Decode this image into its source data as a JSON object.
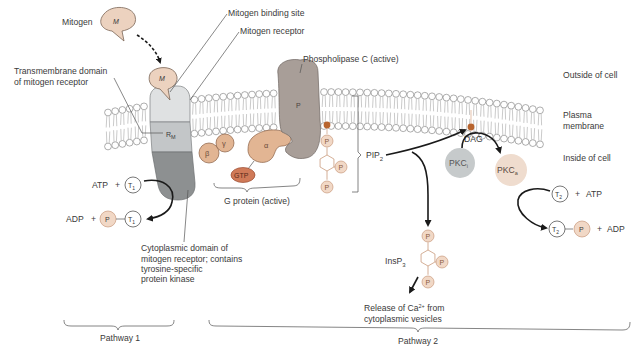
{
  "figure": {
    "labels": {
      "mitogen": "Mitogen",
      "mitogen_binding_site": "Mitogen binding site",
      "mitogen_receptor": "Mitogen receptor",
      "transmembrane_domain_line1": "Transmembrane domain",
      "transmembrane_domain_line2": "of mitogen receptor",
      "phospholipase_c": "Phospholipase C (active)",
      "outside_of_cell": "Outside of cell",
      "plasma_membrane_line1": "Plasma",
      "plasma_membrane_line2": "membrane",
      "inside_of_cell": "Inside of cell",
      "g_protein": "G protein (active)",
      "cytoplasmic_domain_line1": "Cytoplasmic domain of",
      "cytoplasmic_domain_line2": "mitogen receptor; contains",
      "cytoplasmic_domain_line3": "tyrosine-specific",
      "cytoplasmic_domain_line4": "protein kinase",
      "release_ca_line1": "Release of Ca",
      "release_ca_sup": "2+",
      "release_ca_line1_end": " from",
      "release_ca_line2": "cytoplasmic vesicles",
      "pathway_1": "Pathway 1",
      "pathway_2": "Pathway 2"
    },
    "molecules": {
      "mitogen_symbol": "M",
      "receptor_symbol": "R",
      "receptor_subscript": "M",
      "plc_symbol": "P",
      "beta": "β",
      "gamma": "γ",
      "alpha": "α",
      "gtp": "GTP",
      "phosphate": "P",
      "pip2": "PIP",
      "pip2_sub": "2",
      "dag": "DAG",
      "insp3": "InsP",
      "insp3_sub": "3",
      "pkc_inactive": "PKC",
      "pkc_inactive_sub": "i",
      "pkc_active": "PKC",
      "pkc_active_sub": "a",
      "atp": "ATP",
      "adp": "ADP",
      "plus": "+",
      "t1": "T",
      "t1_sub": "1",
      "t2": "T",
      "t2_sub": "2"
    },
    "colors": {
      "mitogen_fill": "#ecd2bf",
      "gprotein_fill": "#e2b593",
      "gtp_fill": "#d07a58",
      "plc_fill": "#a89e98",
      "receptor_top": "#dfe1e2",
      "receptor_mid": "#c3c6c8",
      "receptor_bottom": "#8d9091",
      "dag_dot": "#b8642e",
      "phosphate_fill": "#f1d8c6",
      "phosphate_stroke": "#c99a7c",
      "pkc_inactive_fill": "#c6cacb",
      "pkc_active_fill": "#efdcce"
    }
  }
}
